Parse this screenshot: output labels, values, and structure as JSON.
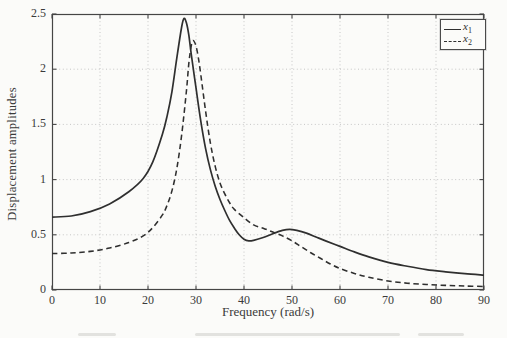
{
  "figure": {
    "legend": [
      {
        "base": "x",
        "sub": "1",
        "style": "solid"
      },
      {
        "base": "x",
        "sub": "2",
        "style": "dashed"
      }
    ]
  },
  "colors": {
    "background": "#fbfbf9",
    "axis": "#454545",
    "grid": "#c6c6c6",
    "curve": "#2f2f2f",
    "text": "#3a3a3a"
  },
  "chart_data": {
    "type": "line",
    "title": "",
    "xlabel": "Frequency (rad/s)",
    "ylabel": "Displacement amplitudes",
    "xlim": [
      0,
      90
    ],
    "ylim": [
      0,
      2.5
    ],
    "xticks": [
      0,
      10,
      20,
      30,
      40,
      50,
      60,
      70,
      80,
      90
    ],
    "yticks": [
      0,
      0.5,
      1,
      1.5,
      2,
      2.5
    ],
    "grid": true,
    "grid_style": "dotted",
    "legend_position": "top-right",
    "series": [
      {
        "name": "x1",
        "style": "solid",
        "points": [
          [
            0,
            0.66
          ],
          [
            4,
            0.67
          ],
          [
            8,
            0.71
          ],
          [
            12,
            0.78
          ],
          [
            16,
            0.89
          ],
          [
            19,
            1.01
          ],
          [
            21,
            1.16
          ],
          [
            23,
            1.41
          ],
          [
            24,
            1.58
          ],
          [
            25,
            1.8
          ],
          [
            26,
            2.1
          ],
          [
            27,
            2.38
          ],
          [
            27.5,
            2.46
          ],
          [
            28,
            2.42
          ],
          [
            28.5,
            2.31
          ],
          [
            29,
            2.14
          ],
          [
            30,
            1.83
          ],
          [
            31,
            1.53
          ],
          [
            32,
            1.28
          ],
          [
            33,
            1.09
          ],
          [
            34,
            0.94
          ],
          [
            35,
            0.82
          ],
          [
            36,
            0.72
          ],
          [
            37,
            0.63
          ],
          [
            38,
            0.56
          ],
          [
            39,
            0.5
          ],
          [
            40,
            0.46
          ],
          [
            41,
            0.445
          ],
          [
            42,
            0.45
          ],
          [
            44,
            0.475
          ],
          [
            46,
            0.51
          ],
          [
            48,
            0.54
          ],
          [
            49.5,
            0.55
          ],
          [
            51,
            0.54
          ],
          [
            53,
            0.515
          ],
          [
            55,
            0.48
          ],
          [
            57,
            0.445
          ],
          [
            60,
            0.395
          ],
          [
            63,
            0.345
          ],
          [
            66,
            0.3
          ],
          [
            70,
            0.25
          ],
          [
            74,
            0.215
          ],
          [
            78,
            0.185
          ],
          [
            82,
            0.165
          ],
          [
            86,
            0.148
          ],
          [
            90,
            0.135
          ]
        ]
      },
      {
        "name": "x2",
        "style": "dashed",
        "points": [
          [
            0,
            0.33
          ],
          [
            4,
            0.335
          ],
          [
            8,
            0.35
          ],
          [
            12,
            0.38
          ],
          [
            16,
            0.43
          ],
          [
            19,
            0.49
          ],
          [
            21,
            0.565
          ],
          [
            23,
            0.68
          ],
          [
            24,
            0.77
          ],
          [
            25,
            0.9
          ],
          [
            26,
            1.1
          ],
          [
            27,
            1.4
          ],
          [
            28,
            1.8
          ],
          [
            28.5,
            2.05
          ],
          [
            29,
            2.21
          ],
          [
            29.4,
            2.26
          ],
          [
            30,
            2.21
          ],
          [
            30.5,
            2.1
          ],
          [
            31,
            1.95
          ],
          [
            32,
            1.62
          ],
          [
            33,
            1.33
          ],
          [
            34,
            1.12
          ],
          [
            35,
            0.97
          ],
          [
            36,
            0.87
          ],
          [
            37,
            0.79
          ],
          [
            38,
            0.73
          ],
          [
            40,
            0.655
          ],
          [
            42,
            0.59
          ],
          [
            44,
            0.56
          ],
          [
            46,
            0.525
          ],
          [
            48,
            0.49
          ],
          [
            50,
            0.445
          ],
          [
            52,
            0.39
          ],
          [
            54,
            0.335
          ],
          [
            56,
            0.285
          ],
          [
            58,
            0.235
          ],
          [
            60,
            0.195
          ],
          [
            63,
            0.15
          ],
          [
            66,
            0.115
          ],
          [
            70,
            0.082
          ],
          [
            74,
            0.062
          ],
          [
            78,
            0.05
          ],
          [
            82,
            0.042
          ],
          [
            86,
            0.036
          ],
          [
            90,
            0.032
          ]
        ]
      }
    ]
  }
}
